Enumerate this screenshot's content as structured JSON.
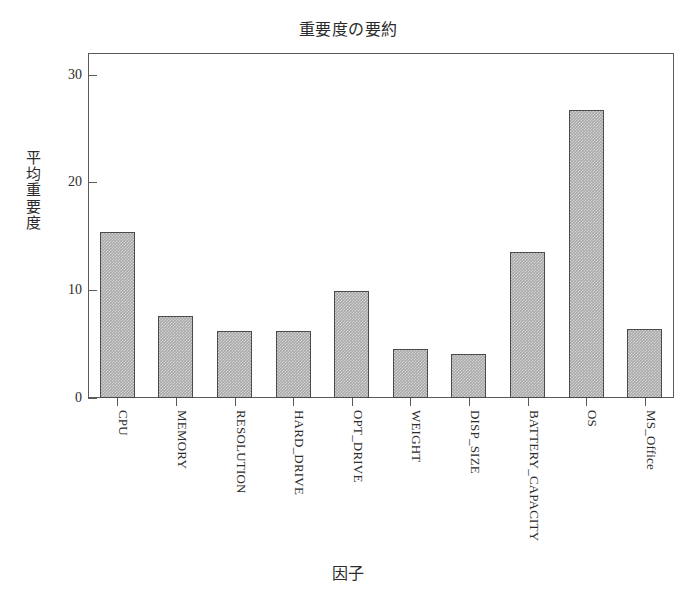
{
  "chart_data": {
    "type": "bar",
    "title": "重要度の要約",
    "xlabel": "因子",
    "ylabel": "平均重要度",
    "categories": [
      "CPU",
      "MEMORY",
      "RESOLUTION",
      "HARD_DRIVE",
      "OPT_DRIVE",
      "WEIGHT",
      "DISP_SIZE",
      "BATTERY_CAPACITY",
      "OS",
      "MS_Office"
    ],
    "values": [
      15.4,
      7.6,
      6.2,
      6.2,
      9.9,
      4.5,
      4.1,
      13.5,
      26.7,
      6.4
    ],
    "ylim": [
      0,
      32
    ],
    "yticks": [
      0,
      10,
      20,
      30
    ],
    "ytick_labels": [
      "0",
      "10",
      "20",
      "30"
    ],
    "grid": false,
    "legend": false,
    "bar_fill_color": "#a9a9a9",
    "bar_edge_color": "#4a4a4a",
    "frame_color": "#5a5a5a",
    "background_color": "#ffffff"
  }
}
